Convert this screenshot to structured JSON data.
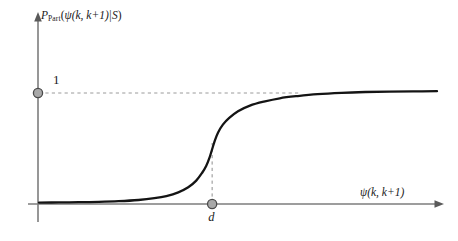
{
  "figure": {
    "background_color": "#ffffff",
    "curve_color": "#141414",
    "axis_color": "#7d7d7d",
    "dashed_color": "#9a9a9a",
    "marker_fill": "#a8a8a8",
    "marker_stroke": "#4a4a4a"
  },
  "axes": {
    "y_label_prefix": "P",
    "y_label_subscript": "Part",
    "y_label_open_paren": "(",
    "y_label_psi": "ψ",
    "y_label_args": "(k, k+1)",
    "y_label_given": "|",
    "y_label_cond": "S",
    "y_label_close_paren": ")",
    "y_label_full": "P_Part(ψ(k, k+1)|S)",
    "x_label_psi": "ψ",
    "x_label_args": "(k, k+1)",
    "x_label_full": "ψ(k, k+1)",
    "y_tick_label": "1",
    "x_tick_label": "d"
  },
  "chart_data": {
    "type": "line",
    "title": "",
    "subtitle": "",
    "xlabel": "ψ(k, k+1)",
    "ylabel": "P_Part(ψ(k, k+1)|S)",
    "grid": false,
    "legend": null,
    "legend_position": "none",
    "xlim": [
      0,
      1
    ],
    "ylim": [
      0,
      1.08
    ],
    "annotations": [
      {
        "name": "upper-asymptote",
        "text": "1",
        "type": "horizontal-dashed-line",
        "y": 1.0,
        "note": "dashed line at probability 1 starting from y-axis marker"
      },
      {
        "name": "threshold",
        "text": "d",
        "type": "vertical-dashed-line",
        "x": 0.435,
        "note": "dashed line at threshold d rising from x-axis to curve inflection"
      }
    ],
    "markers": [
      {
        "name": "y-axis-one-marker",
        "x": 0.0,
        "y": 1.0,
        "label": "1"
      },
      {
        "name": "x-axis-d-marker",
        "x": 0.435,
        "y": 0.0,
        "label": "d"
      }
    ],
    "series": [
      {
        "name": "sigmoid",
        "x": [
          0.0,
          0.05,
          0.1,
          0.15,
          0.2,
          0.25,
          0.29,
          0.32,
          0.35,
          0.375,
          0.395,
          0.41,
          0.42,
          0.428,
          0.435,
          0.442,
          0.45,
          0.462,
          0.478,
          0.5,
          0.53,
          0.565,
          0.605,
          0.65,
          0.7,
          0.76,
          0.82,
          0.88,
          0.94,
          1.0
        ],
        "y": [
          0.004,
          0.005,
          0.007,
          0.01,
          0.016,
          0.027,
          0.043,
          0.062,
          0.095,
          0.14,
          0.2,
          0.27,
          0.33,
          0.4,
          0.48,
          0.56,
          0.63,
          0.7,
          0.76,
          0.82,
          0.87,
          0.905,
          0.935,
          0.955,
          0.972,
          0.984,
          0.991,
          0.995,
          0.997,
          0.998
        ]
      }
    ]
  }
}
